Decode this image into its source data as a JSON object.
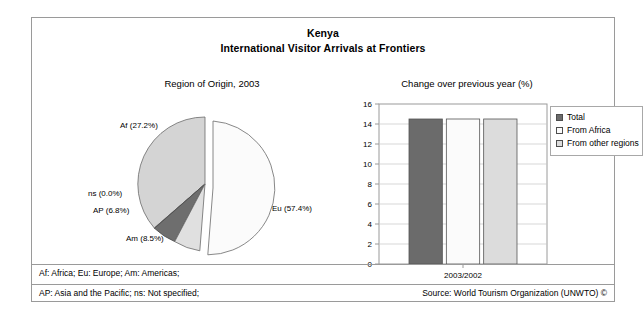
{
  "header": {
    "country": "Kenya",
    "subtitle": "International Visitor Arrivals at Frontiers"
  },
  "pie": {
    "caption": "Region of Origin, 2003",
    "labels": {
      "af": "Af (27.2%)",
      "ns": "ns (0.0%)",
      "ap": "AP (6.8%)",
      "am": "Am (8.5%)",
      "eu": "Eu (57.4%)"
    }
  },
  "bar": {
    "caption": "Change over previous year (%)",
    "xtick": "2003/2002",
    "yticks": [
      "16",
      "14",
      "12",
      "10",
      "8",
      "6",
      "4",
      "2",
      "0"
    ]
  },
  "legend": {
    "items": [
      {
        "label": "Total",
        "color": "#6b6b6b"
      },
      {
        "label": "From Africa",
        "color": "#fbfbfb"
      },
      {
        "label": "From other regions",
        "color": "#dcdcdc"
      }
    ]
  },
  "footer": {
    "note_line_1": "Af: Africa; Eu: Europe; Am: Americas;",
    "note_line_2": "AP: Asia and the Pacific; ns: Not specified;",
    "source": "Source: World Tourism Organization (UNWTO) ©"
  },
  "chart_data": [
    {
      "type": "pie",
      "title": "Region of Origin, 2003",
      "categories": [
        "Eu",
        "Af",
        "Am",
        "AP",
        "ns"
      ],
      "labels": [
        "Eu (57.4%)",
        "Af (27.2%)",
        "Am (8.5%)",
        "AP (6.8%)",
        "ns (0.0%)"
      ],
      "values": [
        57.4,
        27.2,
        8.5,
        6.8,
        0.0
      ],
      "unit": "%",
      "colors": [
        "#fbfbfb",
        "#d2d2d2",
        "#e2e2e2",
        "#6e6e6e",
        "#c9c9c9"
      ],
      "exploded_slice": "Eu",
      "legend": "none",
      "notes": "Af: Africa; Eu: Europe; Am: Americas; AP: Asia and the Pacific; ns: Not specified"
    },
    {
      "type": "bar",
      "title": "Change over previous year (%)",
      "categories": [
        "2003/2002"
      ],
      "xlabel": "",
      "ylabel": "",
      "ylim": [
        0,
        16
      ],
      "ytick_step": 2,
      "grid": true,
      "legend_position": "right",
      "series": [
        {
          "name": "Total",
          "values": [
            14.5
          ],
          "color": "#6b6b6b"
        },
        {
          "name": "From Africa",
          "values": [
            14.5
          ],
          "color": "#fbfbfb"
        },
        {
          "name": "From other regions",
          "values": [
            14.5
          ],
          "color": "#dcdcdc"
        }
      ]
    }
  ]
}
